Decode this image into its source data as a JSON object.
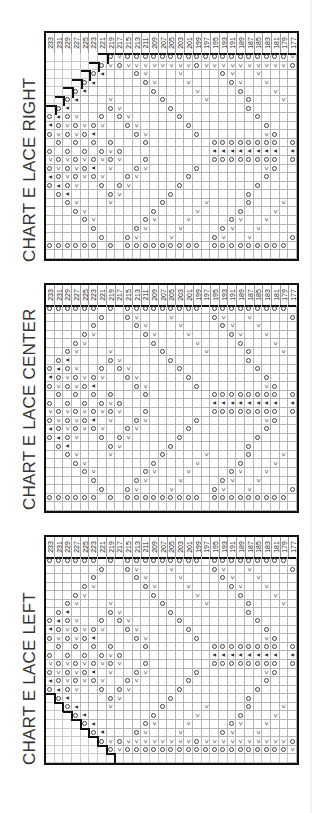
{
  "charts": [
    {
      "title": "CHART E LACE RIGHT",
      "top": 31,
      "title_top": 262,
      "stair": "top-left",
      "columns": [
        "233",
        "231",
        "229",
        "227",
        "225",
        "223",
        "221",
        "219",
        "217",
        "215",
        "213",
        "211",
        "209",
        "207",
        "205",
        "203",
        "201",
        "199",
        "197",
        "195",
        "193",
        "191",
        "189",
        "187",
        "185",
        "183",
        "181",
        "179",
        "177"
      ],
      "rows": [
        "#######O<OOOOOOOOOOOOOOOOOOO<",
        "######O<O<<<<<<<<O<<<<<<<<<<O",
        "#####OA...O<...<....O<..<....",
        "####OA.....O<...<....O<..<...",
        "###OA.......O....<....O...<..",
        "##OA...<.....O....<....O...<.",
        "#OA....O<.....O........O.....",
        "OAO<..O.O<.....O........O....",
        "AO<O<O<..O<.....O........O...",
        "O<O<OA....O<.....O.......<O..",
        ".O.O.O.O...O.......OOOOOOOO.OO",
        "O.O.O.O<O..........AAAAAAAA.AA",
        "<O<O<O<O<..O.......OOOOOOOO.OO",
        "O<O<OA.<..O<.....O.......<O..",
        "AO<O<O<..O<.....O........O...",
        "OAO<..O.O<.....O........O....",
        ".OA....O<.....O........O.....",
        "..O<...<.....O....<....O...<.",
        "...O<.......O....<....O...<..",
        "....O<.....O<...<....O<..<...",
        ".....O....O<...<....O<..<....",
        "......O..O<...<....O<..<....O",
        "OOOOOO.O.OOOOOOOOO.OOOOOOOOO.",
        "............................."
      ]
    },
    {
      "title": "CHART E LACE CENTER",
      "top": 283,
      "title_top": 510,
      "stair": "none",
      "columns": [
        "233",
        "231",
        "229",
        "227",
        "225",
        "223",
        "221",
        "219",
        "217",
        "215",
        "213",
        "211",
        "209",
        "207",
        "205",
        "203",
        "201",
        "199",
        "197",
        "195",
        "193",
        "191",
        "189",
        "187",
        "185",
        "183",
        "181",
        "179",
        "177"
      ],
      "rows": [
        "OOOOOO.O.OOOOOOOOO.OOOOOOOOO.",
        "......O..O<...<....O<..<....O",
        ".....O....O<...<....O<..<....",
        "....O<.....O<...<....O<..<...",
        "...O<.......O....<....O...<..",
        "..O<...<.....O....<....O...<.",
        ".OA....O<.....O........O.....",
        "OAO<..O.O<.....O........O....",
        "AO<O<O<..O<.....O........O...",
        "O<O<OA....O<.....O.......<O..",
        ".O.O.O.O...O.......OOOOOOOO.OO",
        "O.O.O.O<O..........AAAAAAAA.AA",
        "<O<O<O<O<..O.......OOOOOOOO.OO",
        "O<O<OA.<..O<.....O.......<O..",
        "AO<O<O<..O<.....O........O...",
        "OAO<..O.O<.....O........O....",
        ".OA....O<.....O........O.....",
        "..O<...<.....O....<....O...<.",
        "...O<.......O....<....O...<..",
        "....O<.....O<...<....O<..<...",
        ".....O....O<...<....O<..<....",
        "......O..O<...<....O<..<....O",
        "OOOOOO.O.OOOOOOOOO.OOOOOOOOO.",
        "............................."
      ]
    },
    {
      "title": "CHART E LACE LEFT",
      "top": 535,
      "title_top": 765,
      "stair": "bottom-left",
      "columns": [
        "233",
        "231",
        "229",
        "227",
        "225",
        "223",
        "221",
        "219",
        "217",
        "215",
        "213",
        "211",
        "209",
        "207",
        "205",
        "203",
        "201",
        "199",
        "197",
        "195",
        "193",
        "191",
        "189",
        "187",
        "185",
        "183",
        "181",
        "179",
        "177"
      ],
      "rows": [
        "OOOOOO.O.OOOOOOOOO.OOOOOOOOO.",
        "......O..O<...<....O<..<....O",
        ".....O....O<...<....O<..<....",
        "....O<.....O<...<....O<..<...",
        "...O<.......O....<....O...<..",
        "..O<...<.....O....<....O...<.",
        ".OA....O<.....O........O.....",
        "OAO<..O.O<.....O........O....",
        "AO<O<O<..O<.....O........O...",
        "O<O<OA....O<.....O.......<O..",
        ".O.O.O.O...O.......OOOOOOOO.OO",
        "O.O.O.O<O..........AAAAAAAA.AA",
        "<O<O<O<O<..O.......OOOOOOOO.OO",
        "O<O<OA.<..O<.....O.......<O..",
        "AO<O<O<..O<.....O........O...",
        "OAO<..O.O<.....O........O....",
        "#OA....O<.....O........O.....",
        "##OA...<.....O....<....O...<.",
        "###OA.......O....<....O...<..",
        "####OA.....O<...<....O<..<...",
        "#####OA...O<...<....O<..<....",
        "######O<O<<<<<<<<O<<<<<<<<<<O",
        "#######O<OOOOOOOOOOOOOOOOOOO<",
        "############################."
      ]
    }
  ],
  "symbols": {
    "O": "yo-circle",
    "<": "k2tog-slant",
    "A": "sk2p-triangle",
    ".": "knit-blank",
    "#": "no-stitch"
  }
}
